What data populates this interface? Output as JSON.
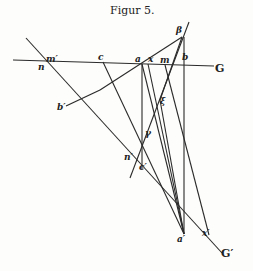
{
  "title": "Figur 5.",
  "labels": {
    "G": "G",
    "G_prime": "G′",
    "n": "n",
    "m_prime": "m′",
    "c": "c",
    "a": "a",
    "x": "x",
    "m": "m",
    "b": "b",
    "beta": "β",
    "b_prime": "b′",
    "xi": "ξ",
    "gamma": "γ",
    "n_prime": "n′",
    "c_prime": "c′",
    "a_prime": "a′",
    "x_prime": "x′"
  },
  "colors": {
    "ink": "#2a2a2a",
    "paper": "#fdfdfb"
  }
}
